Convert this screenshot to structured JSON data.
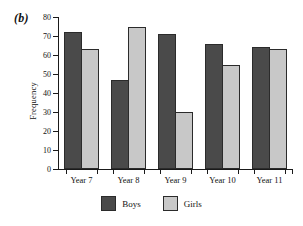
{
  "panel": {
    "label": "(b)"
  },
  "legend": {
    "position": "bottom-center",
    "items": [
      {
        "name": "Boys",
        "color": "#4a4a4a"
      },
      {
        "name": "Girls",
        "color": "#c8c8c8"
      }
    ]
  },
  "axis": {
    "yticks": [
      0,
      10,
      20,
      30,
      40,
      50,
      60,
      70,
      80
    ]
  },
  "chart_data": {
    "type": "bar",
    "title": "",
    "xlabel": "",
    "ylabel": "Frequency",
    "categories": [
      "Year 7",
      "Year 8",
      "Year 9",
      "Year 10",
      "Year 11"
    ],
    "series": [
      {
        "name": "Boys",
        "color": "#4a4a4a",
        "values": [
          72,
          47,
          71,
          66,
          64
        ]
      },
      {
        "name": "Girls",
        "color": "#c8c8c8",
        "values": [
          63,
          75,
          30,
          55,
          63
        ]
      }
    ],
    "ylim": [
      0,
      80
    ],
    "ytick_step": 10,
    "grid": false,
    "legend_position": "bottom-center"
  }
}
